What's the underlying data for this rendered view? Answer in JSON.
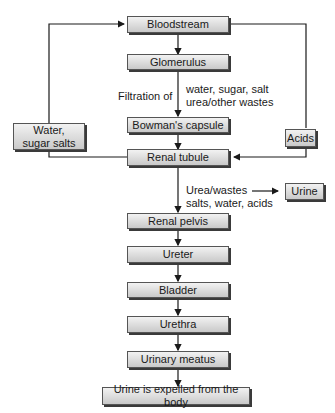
{
  "diagram": {
    "nodes": {
      "bloodstream": "Bloodstream",
      "glomerulus": "Glomerulus",
      "bowmans_capsule": "Bowman's capsule",
      "renal_tubule": "Renal tubule",
      "water_sugar_salts": "Water, sugar salts",
      "acids": "Acids",
      "urine": "Urine",
      "renal_pelvis": "Renal pelvis",
      "ureter": "Ureter",
      "bladder": "Bladder",
      "urethra": "Urethra",
      "urinary_meatus": "Urinary meatus",
      "expelled": "Urine is expelled from the body"
    },
    "labels": {
      "filtration_of": "Filtration of",
      "filtered_1": "water, sugar, salt",
      "filtered_2": "urea/other wastes",
      "wastes_1": "Urea/wastes",
      "wastes_2": "salts, water, acids"
    },
    "colors": {
      "box_fill_top": "#f2f2f2",
      "box_fill_bottom": "#c9c9c9",
      "line": "#1a1a1a"
    }
  }
}
